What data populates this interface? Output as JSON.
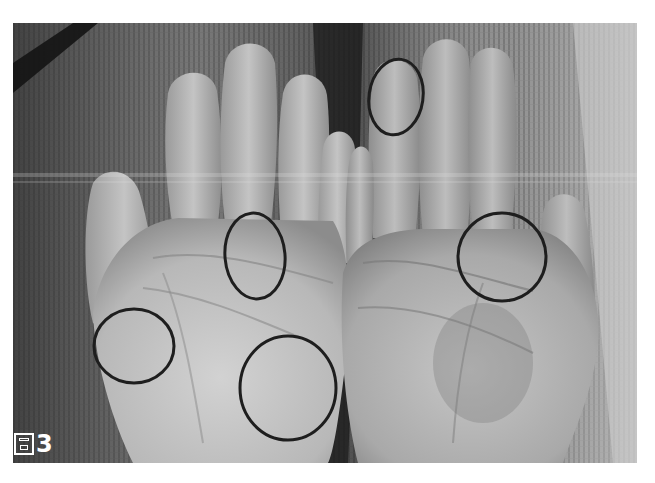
{
  "figure": {
    "caption_label": "圖3",
    "caption_glyph": "圖",
    "caption_number": "3"
  },
  "colors": {
    "page_background": "#ffffff",
    "circle_stroke": "#1e1e1e",
    "caption_text": "#ffffff",
    "fabric_dark": "#4a4a4a",
    "fabric_light": "#b8b8b8",
    "skin_light": "#c9c9c9",
    "skin_mid": "#a8a8a8"
  },
  "annotations": [
    {
      "id": "fingertip-circle",
      "cx": 383,
      "cy": 74,
      "rx": 27,
      "ry": 38,
      "rotate": 8
    },
    {
      "id": "left-palm-upper-circle",
      "cx": 242,
      "cy": 233,
      "rx": 30,
      "ry": 43,
      "rotate": -5
    },
    {
      "id": "right-palm-circle",
      "cx": 489,
      "cy": 234,
      "rx": 44,
      "ry": 44,
      "rotate": 0
    },
    {
      "id": "thumb-base-circle",
      "cx": 121,
      "cy": 323,
      "rx": 40,
      "ry": 37,
      "rotate": 0
    },
    {
      "id": "palm-heel-circle",
      "cx": 275,
      "cy": 365,
      "rx": 48,
      "ry": 52,
      "rotate": 0
    }
  ]
}
